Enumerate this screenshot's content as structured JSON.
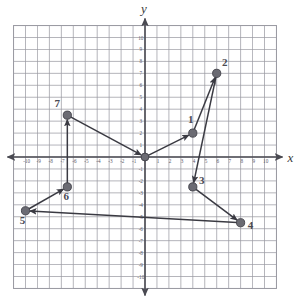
{
  "figure": {
    "caption": "",
    "background": "#ffffff",
    "grid_color": "#9a9aa2",
    "grid_minor_color": "#c4c4cc",
    "axis_color": "#4a4a52",
    "point_color": "#6b6b73",
    "point_edge": "#3f3f47",
    "line_color": "#3a3a42"
  },
  "axes": {
    "x_label": "x",
    "y_label": "y",
    "x_min": -11,
    "x_max": 11,
    "y_min": -11,
    "y_max": 11,
    "x_ticks": [
      -10,
      -9,
      -8,
      -7,
      -6,
      -5,
      -4,
      -3,
      -2,
      -1,
      1,
      2,
      3,
      4,
      5,
      6,
      7,
      8,
      9,
      10
    ],
    "y_ticks": [
      10,
      9,
      8,
      7,
      6,
      5,
      4,
      3,
      2,
      1,
      -1,
      -2,
      -3,
      -4,
      -5,
      -6,
      -7,
      -8,
      -9,
      -10
    ],
    "x_tick_labels": [
      "-10",
      "-9",
      "-8",
      "-7",
      "-6",
      "-5",
      "-4",
      "-3",
      "-2",
      "-1",
      "1",
      "2",
      "3",
      "4",
      "5",
      "6",
      "7",
      "8",
      "9",
      "10"
    ],
    "y_tick_labels": [
      "10",
      "9",
      "8",
      "7",
      "6",
      "5",
      "4",
      "3",
      "2",
      "1",
      "-1",
      "-2",
      "-3",
      "-4",
      "-5",
      "-6",
      "-7",
      "-8",
      "-9",
      "-10"
    ]
  },
  "chart_data": {
    "type": "scatter",
    "title": "",
    "xlabel": "x",
    "ylabel": "y",
    "xlim": [
      -11,
      11
    ],
    "ylim": [
      -11,
      11
    ],
    "grid": true,
    "legend": false,
    "points": [
      {
        "label": "1",
        "x": 4,
        "y": 2,
        "label_dx": -2,
        "label_dy": -10
      },
      {
        "label": "2",
        "x": 6,
        "y": 7,
        "label_dx": 8,
        "label_dy": -7
      },
      {
        "label": "3",
        "x": 4,
        "y": -2.5,
        "label_dx": 9,
        "label_dy": -3
      },
      {
        "label": "4",
        "x": 8,
        "y": -5.5,
        "label_dx": 10,
        "label_dy": 6
      },
      {
        "label": "5",
        "x": -10,
        "y": -4.5,
        "label_dx": -3,
        "label_dy": 13
      },
      {
        "label": "6",
        "x": -6.5,
        "y": -2.5,
        "label_dx": -1,
        "label_dy": 13
      },
      {
        "label": "7",
        "x": -6.5,
        "y": 3.5,
        "label_dx": -10,
        "label_dy": -8
      }
    ],
    "segments": [
      {
        "from": [
          0,
          0
        ],
        "to": [
          4,
          2
        ],
        "arrow": true
      },
      {
        "from": [
          4,
          2
        ],
        "to": [
          6,
          7
        ],
        "arrow": true
      },
      {
        "from": [
          6,
          7
        ],
        "to": [
          4,
          -2.5
        ],
        "arrow": true
      },
      {
        "from": [
          4,
          -2.5
        ],
        "to": [
          8,
          -5.5
        ],
        "arrow": true
      },
      {
        "from": [
          8,
          -5.5
        ],
        "to": [
          -10,
          -4.5
        ],
        "arrow": true
      },
      {
        "from": [
          -10,
          -4.5
        ],
        "to": [
          -6.5,
          -2.5
        ],
        "arrow": true
      },
      {
        "from": [
          -6.5,
          -2.5
        ],
        "to": [
          -6.5,
          3.5
        ],
        "arrow": true
      },
      {
        "from": [
          -6.5,
          3.5
        ],
        "to": [
          0,
          0
        ],
        "arrow": true
      }
    ]
  }
}
